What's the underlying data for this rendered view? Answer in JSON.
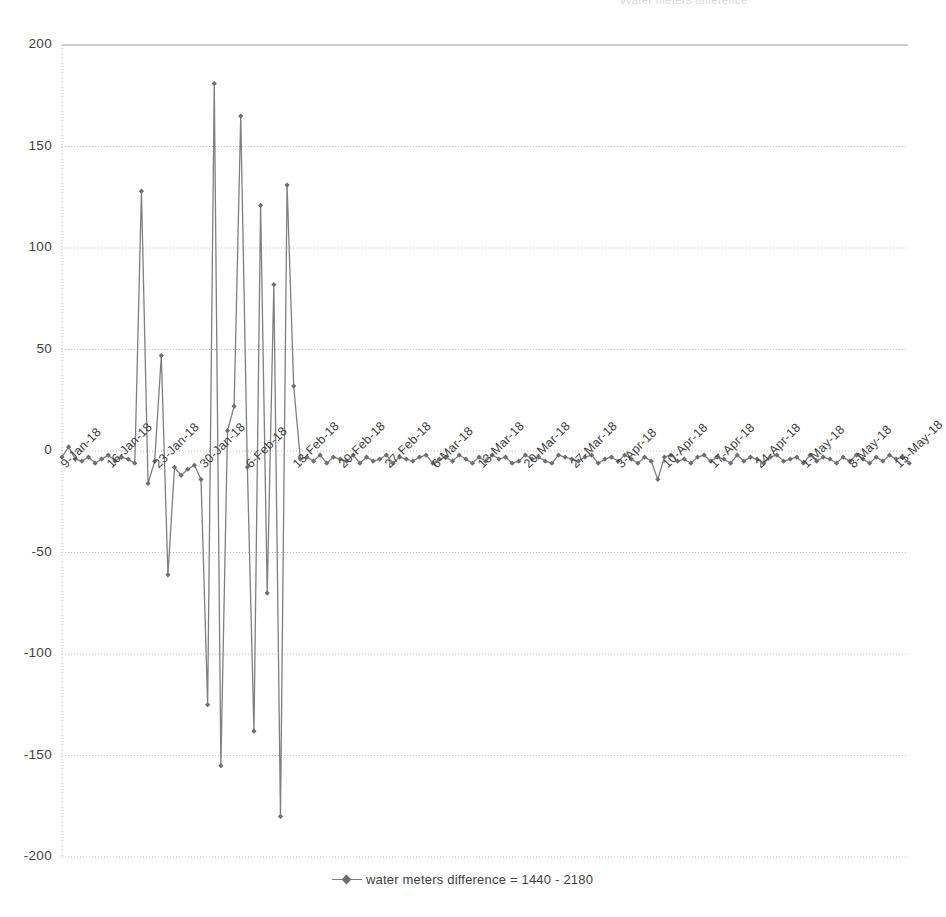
{
  "page": {
    "background": "#ffffff",
    "top_cut_text": "vvater meters difference"
  },
  "legend": {
    "position": "bottom-center",
    "marker_icon": "line-diamond-marker",
    "label": "water meters difference = 1440 - 2180"
  },
  "style": {
    "series_color": "#7f7f7f",
    "marker_color": "#6e6e6e",
    "grid_color": "#bfbfbf",
    "axis_color": "#9a9a9a",
    "text_color": "#3f3f3f"
  },
  "chart_data": {
    "type": "line",
    "title": "",
    "subtitle": "",
    "xlabel": "",
    "ylabel": "",
    "ylim": [
      -200,
      200
    ],
    "ytick_step": 50,
    "yticks": [
      200,
      150,
      100,
      50,
      0,
      -50,
      -100,
      -150,
      -200
    ],
    "ytick_labels": [
      "200",
      "150",
      "100",
      "50",
      "0",
      "-50",
      "-100",
      "-150",
      "-200"
    ],
    "grid": "horizontal-dotted",
    "legend_position": "bottom",
    "xtick_labels": [
      "9-Jan-18",
      "16-Jan-18",
      "23-Jan-18",
      "30-Jan-18",
      "6-Feb-18",
      "13-Feb-18",
      "20-Feb-18",
      "27-Feb-18",
      "6-Mar-18",
      "13-Mar-18",
      "20-Mar-18",
      "27-Mar-18",
      "3-Apr-18",
      "10-Apr-18",
      "17-Apr-18",
      "24-Apr-18",
      "1-May-18",
      "8-May-18",
      "15-May-18"
    ],
    "xtick_indices": [
      0,
      7,
      14,
      21,
      28,
      35,
      42,
      49,
      56,
      63,
      70,
      77,
      84,
      91,
      98,
      105,
      112,
      119,
      126
    ],
    "series": [
      {
        "name": "water meters difference = 1440 - 2180",
        "marker": "diamond",
        "values": [
          -3,
          2,
          -4,
          -5,
          -3,
          -6,
          -4,
          -2,
          -5,
          -3,
          -4,
          -6,
          128,
          -16,
          -5,
          47,
          -61,
          -8,
          -12,
          -9,
          -7,
          -14,
          -125,
          181,
          -155,
          10,
          22,
          165,
          -8,
          -138,
          121,
          -70,
          82,
          -180,
          131,
          32,
          -4,
          -3,
          -5,
          -2,
          -6,
          -3,
          -4,
          -5,
          -2,
          -6,
          -3,
          -5,
          -4,
          -2,
          -6,
          -3,
          -4,
          -5,
          -3,
          -2,
          -6,
          -4,
          -3,
          -5,
          -2,
          -4,
          -6,
          -3,
          -5,
          -2,
          -4,
          -3,
          -6,
          -5,
          -2,
          -4,
          -3,
          -5,
          -6,
          -2,
          -3,
          -4,
          -5,
          -3,
          -2,
          -6,
          -4,
          -3,
          -5,
          -2,
          -4,
          -6,
          -3,
          -5,
          -14,
          -3,
          -2,
          -5,
          -4,
          -6,
          -3,
          -2,
          -5,
          -3,
          -4,
          -6,
          -2,
          -5,
          -3,
          -4,
          -6,
          -3,
          -2,
          -5,
          -4,
          -3,
          -6,
          -2,
          -5,
          -3,
          -4,
          -6,
          -3,
          -5,
          -2,
          -4,
          -6,
          -3,
          -5,
          -2,
          -4,
          -3,
          -6
        ]
      }
    ]
  }
}
